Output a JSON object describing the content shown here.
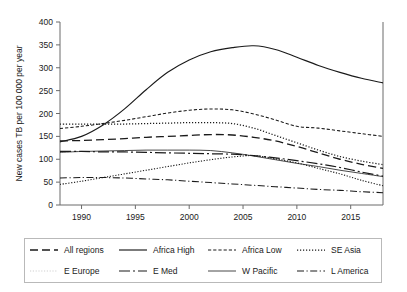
{
  "chart_data": {
    "type": "line",
    "title": "",
    "xlabel": "",
    "ylabel": "New cases TB per 100 000 per year",
    "xlim": [
      1988,
      2018
    ],
    "ylim": [
      0,
      400
    ],
    "grid": false,
    "legend_position": "bottom",
    "x_ticks": [
      "1990",
      "1995",
      "2000",
      "2005",
      "2010",
      "2015"
    ],
    "x_tick_values": [
      1990,
      1995,
      2000,
      2005,
      2010,
      2015
    ],
    "y_ticks": [
      "0",
      "50",
      "100",
      "150",
      "200",
      "250",
      "300",
      "350",
      "400"
    ],
    "y_tick_values": [
      0,
      50,
      100,
      150,
      200,
      250,
      300,
      350,
      400
    ],
    "x": [
      1988,
      1990,
      1992,
      1994,
      1996,
      1998,
      2000,
      2002,
      2004,
      2006,
      2008,
      2010,
      2012,
      2014,
      2016,
      2018
    ],
    "series": [
      {
        "name": "All regions",
        "style": "long-dash",
        "color": "#1a1a1a",
        "values": [
          140,
          141,
          143,
          145,
          148,
          150,
          152,
          154,
          153,
          148,
          140,
          128,
          114,
          100,
          89,
          80
        ]
      },
      {
        "name": "Africa High",
        "style": "solid",
        "color": "#1a1a1a",
        "values": [
          138,
          150,
          175,
          210,
          252,
          290,
          317,
          335,
          344,
          348,
          340,
          323,
          305,
          290,
          277,
          267
        ]
      },
      {
        "name": "Africa Low",
        "style": "short-dash",
        "color": "#1a1a1a",
        "values": [
          167,
          172,
          178,
          185,
          193,
          201,
          207,
          210,
          208,
          199,
          186,
          172,
          168,
          162,
          156,
          150
        ]
      },
      {
        "name": "SE Asia",
        "style": "dotted",
        "color": "#1a1a1a",
        "values": [
          177,
          177,
          177,
          177,
          178,
          179,
          180,
          180,
          178,
          168,
          152,
          136,
          120,
          106,
          96,
          88
        ]
      },
      {
        "name": "E Europe",
        "style": "faint-dotted",
        "color": "#cfcfcf",
        "values": [
          45,
          52,
          60,
          68,
          76,
          84,
          92,
          99,
          105,
          108,
          101,
          92,
          80,
          68,
          54,
          42
        ]
      },
      {
        "name": "E Med",
        "style": "dash-dot-long",
        "color": "#1a1a1a",
        "values": [
          117,
          117,
          116,
          116,
          115,
          114,
          113,
          112,
          111,
          108,
          103,
          97,
          90,
          82,
          72,
          63
        ]
      },
      {
        "name": "W Pacific",
        "style": "thin-solid",
        "color": "#1a1a1a",
        "values": [
          115,
          117,
          118,
          119,
          120,
          120,
          120,
          119,
          114,
          107,
          99,
          91,
          84,
          76,
          69,
          62
        ]
      },
      {
        "name": "L America",
        "style": "dash-dot",
        "color": "#1a1a1a",
        "values": [
          59,
          60,
          60,
          59,
          57,
          55,
          52,
          49,
          46,
          43,
          40,
          37,
          34,
          32,
          29,
          27
        ]
      }
    ]
  },
  "legend": {
    "rows": [
      [
        {
          "label": "All regions",
          "style": "long-dash"
        },
        {
          "label": "Africa High",
          "style": "solid"
        },
        {
          "label": "Africa Low",
          "style": "short-dash"
        },
        {
          "label": "SE Asia",
          "style": "dotted"
        }
      ],
      [
        {
          "label": "E Europe",
          "style": "faint-dotted"
        },
        {
          "label": "E Med",
          "style": "dash-dot-long"
        },
        {
          "label": "W Pacific",
          "style": "thin-solid"
        },
        {
          "label": "L America",
          "style": "dash-dot"
        }
      ]
    ]
  },
  "colors": {
    "axis": "#6b6b6b",
    "text": "#1a1a1a",
    "line": "#1a1a1a",
    "faint_line": "#cfcfcf",
    "legend_border": "#b9b9b9"
  }
}
